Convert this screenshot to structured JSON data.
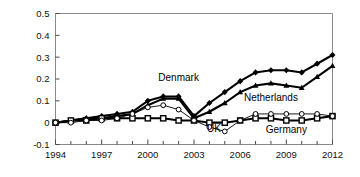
{
  "chart_data": {
    "type": "line",
    "title": "",
    "subtitle": "",
    "xlabel": "",
    "ylabel": "",
    "xlim": [
      1994,
      2012
    ],
    "ylim": [
      -0.1,
      0.5
    ],
    "grid": false,
    "legend_position": "inline-annotations",
    "xticks": [
      "1994",
      "1997",
      "2000",
      "2003",
      "2006",
      "2009",
      "2012"
    ],
    "xtick_values": [
      1994,
      1997,
      2000,
      2003,
      2006,
      2009,
      2012
    ],
    "xminor_step": 1,
    "yticks": [
      "0.5",
      "0.4",
      "0.3",
      "0.2",
      "0.1",
      "0",
      "-0.1"
    ],
    "ytick_values": [
      0.5,
      0.4,
      0.3,
      0.2,
      0.1,
      0,
      -0.1
    ],
    "x": [
      1994,
      1995,
      1996,
      1997,
      1998,
      1999,
      2000,
      2001,
      2002,
      2003,
      2004,
      2005,
      2006,
      2007,
      2008,
      2009,
      2010,
      2011,
      2012
    ],
    "series": [
      {
        "name": "Denmark",
        "marker": "filled-diamond",
        "line": "thick-solid",
        "color": "#000000",
        "values": [
          0.0,
          0.01,
          0.02,
          0.03,
          0.04,
          0.05,
          0.1,
          0.12,
          0.12,
          0.03,
          0.09,
          0.14,
          0.19,
          0.23,
          0.24,
          0.24,
          0.23,
          0.27,
          0.31
        ]
      },
      {
        "name": "Netherlands",
        "marker": "filled-triangle",
        "line": "thick-solid",
        "color": "#000000",
        "values": [
          0.0,
          0.01,
          0.02,
          0.02,
          0.03,
          0.04,
          0.08,
          0.11,
          0.11,
          0.02,
          0.05,
          0.09,
          0.14,
          0.17,
          0.18,
          0.17,
          0.16,
          0.21,
          0.26
        ]
      },
      {
        "name": "UK",
        "marker": "filled-square",
        "line": "thick-solid",
        "color": "#000000",
        "values": [
          0.0,
          0.01,
          0.01,
          0.02,
          0.02,
          0.02,
          0.02,
          0.02,
          0.01,
          0.01,
          0.0,
          0.0,
          0.01,
          0.02,
          0.02,
          0.01,
          0.01,
          0.02,
          0.03
        ]
      },
      {
        "name": "Germany",
        "marker": "open-circle",
        "line": "thin-solid",
        "color": "#000000",
        "values": [
          0.0,
          0.0,
          0.01,
          0.01,
          0.02,
          0.04,
          0.07,
          0.08,
          0.06,
          0.01,
          -0.02,
          -0.04,
          0.01,
          0.04,
          0.04,
          0.04,
          0.04,
          0.04,
          0.03
        ]
      }
    ],
    "annotations": [
      {
        "text": "Denmark",
        "x": 2002.0,
        "y": 0.205,
        "anchor": "middle"
      },
      {
        "text": "Netherlands",
        "x": 2008.0,
        "y": 0.115,
        "anchor": "middle"
      },
      {
        "text": "UK",
        "x": 2004.3,
        "y": -0.028,
        "anchor": "middle"
      },
      {
        "text": "Germany",
        "x": 2009.0,
        "y": -0.033,
        "anchor": "middle"
      }
    ]
  }
}
